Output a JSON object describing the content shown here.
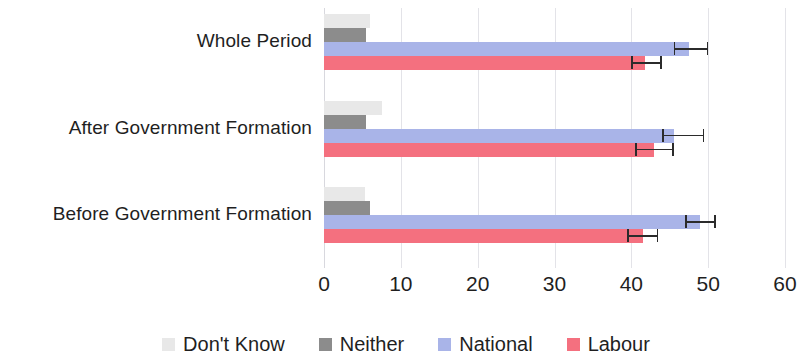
{
  "chart_data": {
    "type": "bar",
    "orientation": "horizontal",
    "title": "",
    "xlabel": "",
    "ylabel": "",
    "xlim": [
      0,
      60
    ],
    "xticks": [
      0,
      10,
      20,
      30,
      40,
      50,
      60
    ],
    "xtick_labels": [
      "0",
      "10",
      "20",
      "30",
      "40",
      "50",
      "60"
    ],
    "grid": true,
    "grid_axis": "x",
    "legend_position": "bottom",
    "categories": [
      "Whole Period",
      "After Government Formation",
      "Before Government Formation"
    ],
    "series": [
      {
        "name": "Don't Know",
        "color": "#e8e8e8",
        "values": [
          6.0,
          7.5,
          5.3
        ],
        "errors": [
          null,
          null,
          null
        ]
      },
      {
        "name": "Neither",
        "color": "#8c8c8c",
        "values": [
          5.5,
          5.5,
          6.0
        ],
        "errors": [
          null,
          null,
          null
        ]
      },
      {
        "name": "National",
        "color": "#a9b4e8",
        "values": [
          47.5,
          45.5,
          49.0
        ],
        "errors": [
          {
            "low": 45.5,
            "high": 50.0
          },
          {
            "low": 44.0,
            "high": 49.5
          },
          {
            "low": 47.0,
            "high": 51.0
          }
        ]
      },
      {
        "name": "Labour",
        "color": "#f4707f",
        "values": [
          41.8,
          43.0,
          41.5
        ],
        "errors": [
          {
            "low": 40.0,
            "high": 44.0
          },
          {
            "low": 40.5,
            "high": 45.5
          },
          {
            "low": 39.5,
            "high": 43.5
          }
        ]
      }
    ]
  },
  "legend": {
    "items": [
      {
        "label": "Don't Know",
        "color": "#e8e8e8",
        "icon": "square-swatch-icon"
      },
      {
        "label": "Neither",
        "color": "#8c8c8c",
        "icon": "square-swatch-icon"
      },
      {
        "label": "National",
        "color": "#a9b4e8",
        "icon": "square-swatch-icon"
      },
      {
        "label": "Labour",
        "color": "#f4707f",
        "icon": "square-swatch-icon"
      }
    ]
  }
}
